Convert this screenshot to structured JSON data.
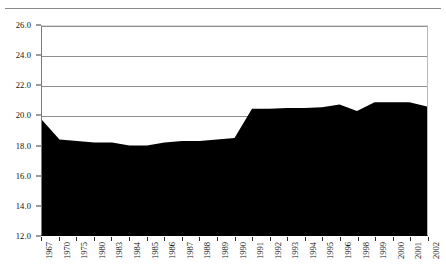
{
  "chart_data": {
    "type": "area",
    "title": "",
    "subtitle": "",
    "xlabel": "",
    "ylabel": "",
    "categories": [
      "1967",
      "1970",
      "1975",
      "1980",
      "1983",
      "1984",
      "1985",
      "1986",
      "1987",
      "1988",
      "1989",
      "1990",
      "1991",
      "1992",
      "1993",
      "1994",
      "1995",
      "1996",
      "1998",
      "1999",
      "2000",
      "2001",
      "2002"
    ],
    "values": [
      19.7,
      18.4,
      18.3,
      18.2,
      18.2,
      18.0,
      18.0,
      18.2,
      18.3,
      18.3,
      18.4,
      18.5,
      20.45,
      20.45,
      20.5,
      20.5,
      20.55,
      20.75,
      20.3,
      20.9,
      20.9,
      20.9,
      20.6
    ],
    "series": [
      {
        "name": "value",
        "values": [
          19.7,
          18.4,
          18.3,
          18.2,
          18.2,
          18.0,
          18.0,
          18.2,
          18.3,
          18.3,
          18.4,
          18.5,
          20.45,
          20.45,
          20.5,
          20.5,
          20.55,
          20.75,
          20.3,
          20.9,
          20.9,
          20.9,
          20.6
        ],
        "color": "#000000",
        "fill": "#000000"
      }
    ],
    "ylim": [
      12.0,
      26.0
    ],
    "yticks": [
      12.0,
      14.0,
      16.0,
      18.0,
      20.0,
      22.0,
      24.0,
      26.0
    ],
    "ytick_labels": [
      "12.0",
      "14.0",
      "16.0",
      "18.0",
      "20.0",
      "22.0",
      "24.0",
      "26.0"
    ],
    "grid": true,
    "grid_axis": "y",
    "grid_color": "#8f8f8f",
    "legend": false,
    "legend_position": "none",
    "plot_background": "#ffffff",
    "axis_color": "#000000",
    "baseline_value": 12.0
  },
  "figure": {
    "background": "#ffffff",
    "top_rule_color": "#8a8a8a",
    "width": 446,
    "height": 280
  }
}
